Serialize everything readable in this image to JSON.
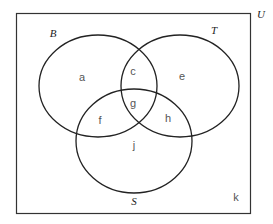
{
  "diagram": {
    "type": "venn",
    "universe_label": "U",
    "sets": [
      {
        "name": "B",
        "label": "B"
      },
      {
        "name": "T",
        "label": "T"
      },
      {
        "name": "S",
        "label": "S"
      }
    ],
    "regions": {
      "a": "a",
      "c": "c",
      "e": "e",
      "g": "g",
      "f": "f",
      "h": "h",
      "j": "j",
      "k": "k"
    }
  }
}
